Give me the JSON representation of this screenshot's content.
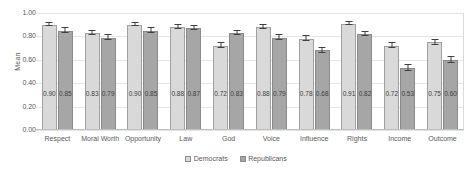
{
  "chart_data": {
    "type": "bar",
    "title": "",
    "subtitle": "",
    "xlabel": "",
    "ylabel": "Mean",
    "ylim": [
      0.0,
      1.0
    ],
    "ytick_labels": [
      "1.00",
      "0.80",
      "0.60",
      "0.40",
      "0.20",
      "0.00"
    ],
    "ytick_values": [
      1.0,
      0.8,
      0.6,
      0.4,
      0.2,
      0.0
    ],
    "grid": true,
    "legend_position": "bottom-center",
    "categories": [
      "Respect",
      "Moral Worth",
      "Opportunity",
      "Law",
      "God",
      "Voice",
      "Influence",
      "Rights",
      "Income",
      "Outcome"
    ],
    "series": [
      {
        "name": "Democrats",
        "color": "#d9d9d9",
        "values": [
          0.9,
          0.83,
          0.9,
          0.88,
          0.72,
          0.88,
          0.78,
          0.91,
          0.72,
          0.75
        ],
        "labels": [
          "0.90",
          "0.83",
          "0.90",
          "0.88",
          "0.72",
          "0.88",
          "0.78",
          "0.91",
          "0.72",
          "0.75"
        ],
        "errors": [
          0.015,
          0.018,
          0.014,
          0.014,
          0.022,
          0.016,
          0.02,
          0.013,
          0.022,
          0.022
        ]
      },
      {
        "name": "Republicans",
        "color": "#a6a6a6",
        "values": [
          0.85,
          0.79,
          0.85,
          0.87,
          0.83,
          0.79,
          0.68,
          0.82,
          0.53,
          0.6
        ],
        "labels": [
          "0.85",
          "0.79",
          "0.85",
          "0.87",
          "0.83",
          "0.79",
          "0.68",
          "0.82",
          "0.53",
          "0.60"
        ],
        "errors": [
          0.018,
          0.02,
          0.018,
          0.017,
          0.02,
          0.021,
          0.024,
          0.019,
          0.026,
          0.026
        ]
      }
    ]
  },
  "legend": {
    "items": [
      {
        "label": "Democrats"
      },
      {
        "label": "Republicans"
      }
    ]
  }
}
